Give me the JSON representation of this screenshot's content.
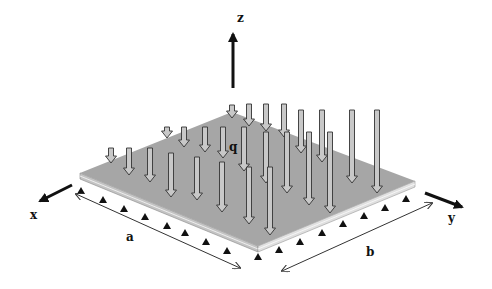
{
  "figure": {
    "axes": {
      "x_label": "x",
      "y_label": "y",
      "z_label": "z"
    },
    "load_label": "q",
    "dimensions": {
      "length_label": "a",
      "width_label": "b"
    },
    "colors": {
      "plate_top": "#a6a6a6",
      "plate_edge": "#d8d8d8",
      "arrow_fill": "#c8c8c8",
      "arrow_stroke": "#333333",
      "support": "#111111",
      "background": "#ffffff"
    }
  }
}
